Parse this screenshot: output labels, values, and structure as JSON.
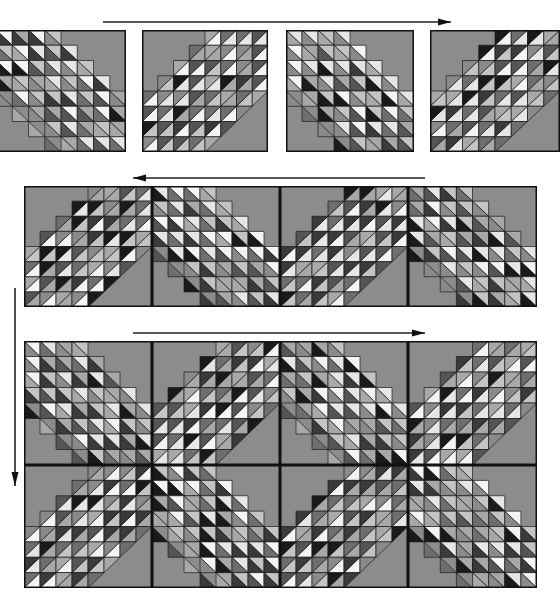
{
  "diagram": {
    "title": "",
    "background_color": "#ffffff",
    "block_background_color": "#8c8c8c",
    "outline_color": "#111111",
    "triangle_palette": [
      "#1a1a1a",
      "#3a3a3a",
      "#555555",
      "#6e6e6e",
      "#8a8a8a",
      "#a8a8a8",
      "#c4c4c4",
      "#e6e6e6",
      "#f4f4f4"
    ],
    "grid_cells_per_block": 8,
    "band_width_cells": 4
  },
  "steps": [
    {
      "name": "step-1-individual-blocks",
      "arrow": {
        "direction": "right",
        "x1": 103,
        "y1": 22,
        "x2": 451,
        "y2": 22
      },
      "blocks": [
        {
          "x": -4,
          "y": 30,
          "w": 130,
          "h": 122,
          "orientation": "A",
          "seed": 11
        },
        {
          "x": 142,
          "y": 30,
          "w": 126,
          "h": 122,
          "orientation": "B",
          "seed": 23
        },
        {
          "x": 286,
          "y": 30,
          "w": 128,
          "h": 122,
          "orientation": "A",
          "seed": 37
        },
        {
          "x": 430,
          "y": 30,
          "w": 130,
          "h": 122,
          "orientation": "B",
          "seed": 41
        }
      ]
    },
    {
      "name": "step-2-joined-row",
      "arrow": {
        "direction": "left",
        "x1": 425,
        "y1": 178,
        "x2": 133,
        "y2": 178
      },
      "blocks": [
        {
          "x": 24,
          "y": 186,
          "w": 128,
          "h": 121,
          "orientation": "B",
          "seed": 53
        },
        {
          "x": 152,
          "y": 186,
          "w": 128,
          "h": 121,
          "orientation": "A",
          "seed": 61
        },
        {
          "x": 280,
          "y": 186,
          "w": 128,
          "h": 121,
          "orientation": "B",
          "seed": 71
        },
        {
          "x": 408,
          "y": 186,
          "w": 129,
          "h": 121,
          "orientation": "A",
          "seed": 83
        }
      ]
    },
    {
      "name": "step-3-joined-rows",
      "arrow": {
        "direction": "right",
        "x1": 133,
        "y1": 333,
        "x2": 425,
        "y2": 333
      },
      "blocks": [
        {
          "x": 24,
          "y": 341,
          "w": 128,
          "h": 124,
          "orientation": "A",
          "seed": 97
        },
        {
          "x": 152,
          "y": 341,
          "w": 128,
          "h": 124,
          "orientation": "B",
          "seed": 101
        },
        {
          "x": 280,
          "y": 341,
          "w": 128,
          "h": 124,
          "orientation": "A",
          "seed": 113
        },
        {
          "x": 408,
          "y": 341,
          "w": 129,
          "h": 124,
          "orientation": "B",
          "seed": 127
        },
        {
          "x": 24,
          "y": 465,
          "w": 128,
          "h": 123,
          "orientation": "B",
          "seed": 131
        },
        {
          "x": 152,
          "y": 465,
          "w": 128,
          "h": 123,
          "orientation": "A",
          "seed": 149
        },
        {
          "x": 280,
          "y": 465,
          "w": 128,
          "h": 123,
          "orientation": "B",
          "seed": 151
        },
        {
          "x": 408,
          "y": 465,
          "w": 129,
          "h": 123,
          "orientation": "A",
          "seed": 163
        }
      ]
    }
  ],
  "vertical_arrow": {
    "direction": "down",
    "x1": 15,
    "y1": 288,
    "x2": 15,
    "y2": 486
  }
}
